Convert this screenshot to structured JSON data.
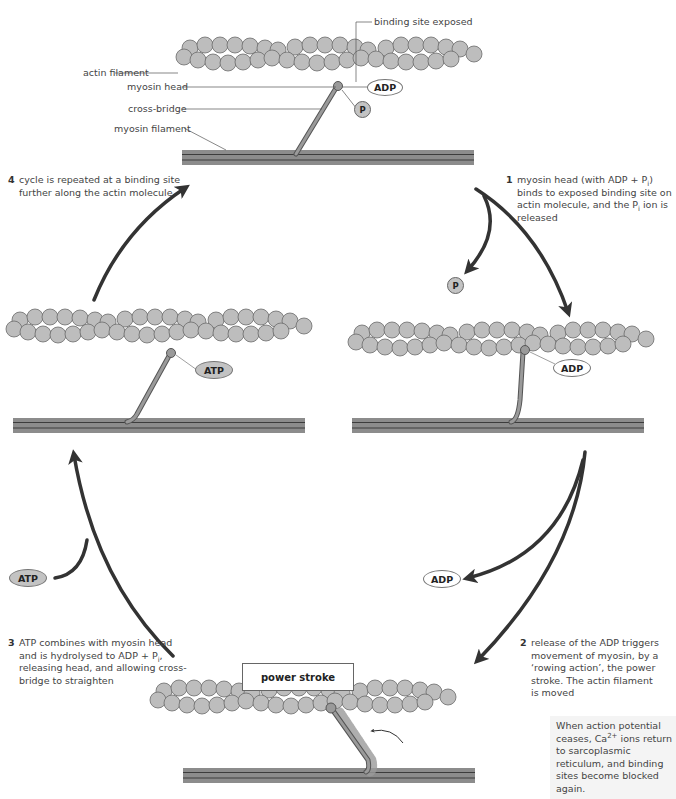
{
  "figure": {
    "colors": {
      "actin_fill": "#bdbdbd",
      "actin_stroke": "#6b6b6b",
      "myosin_filament": "#8c8c8c",
      "myosin_line": "#3c3c3c",
      "arrow": "#333333",
      "note_bg": "#f4f4f4"
    }
  },
  "top_panel": {
    "labels": {
      "binding_site": "binding site exposed",
      "actin": "actin filament",
      "myosin_head": "myosin head",
      "cross_bridge": "cross-bridge",
      "myosin_filament": "myosin filament"
    },
    "adp": "ADP",
    "p": "P"
  },
  "steps": [
    {
      "num": "1",
      "text_a": "myosin head (with ADP + P",
      "sub_a": "i",
      "text_b": ") binds to exposed binding site on actin molecule, and the P",
      "sub_b": "i",
      "text_c": " ion is released"
    },
    {
      "num": "2",
      "text": "release of the ADP triggers movement of myosin, by a ‘rowing action’, the power stroke. The actin filament is moved"
    },
    {
      "num": "3",
      "text_a": "ATP combines with myosin head and is hydrolysed to ADP + P",
      "sub_a": "i",
      "text_b": ", releasing head, and allowing cross-bridge to straighten"
    },
    {
      "num": "4",
      "text": "cycle is repeated at a binding site further along the actin molecule"
    }
  ],
  "right_panel": {
    "adp": "ADP",
    "released_p": "P"
  },
  "left_panel": {
    "atp": "ATP"
  },
  "arrow_labels": {
    "adp_released": "ADP",
    "atp_added": "ATP"
  },
  "power_stroke": {
    "label": "power stroke"
  },
  "note": {
    "text_a": "When action potential ceases, Ca",
    "sup": "2+",
    "text_b": " ions return to sarcoplasmic reticulum, and binding sites become blocked again."
  }
}
